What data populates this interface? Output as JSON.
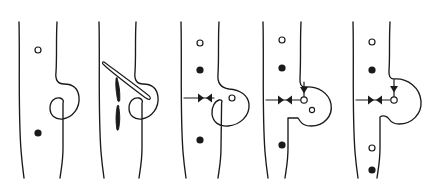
{
  "figure": {
    "type": "scientific-line-diagram",
    "background_color": "#ffffff",
    "stroke_color": "#1a1a1a",
    "width": 436,
    "height": 193,
    "panel_count": 5
  },
  "panels": [
    {
      "id": "panel-1",
      "index": 1,
      "stage_label": "1",
      "left_boundary": {
        "x_top": 18,
        "x_bottom": 24
      },
      "right_boundary": {
        "x_top": 56,
        "x_bottom": 60
      },
      "markers": [
        {
          "name": "open-dot",
          "style": "open",
          "cx": 38,
          "cy": 50,
          "r": 3
        },
        {
          "name": "filled-dot",
          "style": "filled",
          "cx": 38,
          "cy": 133,
          "r": 3.6
        }
      ],
      "features": [
        "bud-outline"
      ]
    },
    {
      "id": "panel-2",
      "index": 2,
      "stage_label": "2",
      "left_boundary": {
        "x_top": 98,
        "x_bottom": 103
      },
      "right_boundary": {
        "x_top": 134,
        "x_bottom": 138
      },
      "markers": [
        {
          "name": "dark-spindle",
          "style": "filled-spindle",
          "cx": 117,
          "cy": 103
        },
        {
          "name": "open-needle",
          "style": "open-spindle",
          "angle_deg": 34
        }
      ],
      "features": [
        "bud-outline",
        "neck-constriction"
      ]
    },
    {
      "id": "panel-3",
      "index": 3,
      "stage_label": "3",
      "left_boundary": {
        "x_top": 180,
        "x_bottom": 186
      },
      "right_boundary": {
        "x_top": 218,
        "x_bottom": 222
      },
      "markers": [
        {
          "name": "open-dot",
          "style": "open",
          "cx": 200,
          "cy": 43,
          "r": 3
        },
        {
          "name": "filled-dot",
          "style": "filled",
          "cx": 200,
          "cy": 70,
          "r": 3.6
        },
        {
          "name": "filled-dot",
          "style": "filled",
          "cx": 200,
          "cy": 140,
          "r": 3.6
        },
        {
          "name": "open-dot-inner",
          "style": "open",
          "cx": 232,
          "cy": 98,
          "r": 3
        },
        {
          "name": "arrowhead-pair-horizontal",
          "style": "opposed-triangles",
          "cy": 98
        }
      ],
      "features": [
        "bud-outline",
        "neck-constriction",
        "horizontal-tension-arrows"
      ]
    },
    {
      "id": "panel-4",
      "index": 4,
      "stage_label": "4",
      "left_boundary": {
        "x_top": 262,
        "x_bottom": 268
      },
      "right_boundary": {
        "x_top": 300,
        "x_bottom": 304
      },
      "markers": [
        {
          "name": "open-dot",
          "style": "open",
          "cx": 282,
          "cy": 40,
          "r": 3
        },
        {
          "name": "filled-dot",
          "style": "filled",
          "cx": 282,
          "cy": 68,
          "r": 3.6
        },
        {
          "name": "filled-dot",
          "style": "filled",
          "cx": 282,
          "cy": 145,
          "r": 3.6
        },
        {
          "name": "open-dot-junction",
          "style": "open",
          "cx": 304,
          "cy": 100,
          "r": 3.2
        },
        {
          "name": "open-dot-inner",
          "style": "open",
          "cx": 312,
          "cy": 110,
          "r": 2.6
        },
        {
          "name": "arrowhead-pair-horizontal",
          "style": "opposed-triangles",
          "cy": 100
        },
        {
          "name": "arrowhead-down-vertical",
          "style": "down-triangle",
          "cx": 304
        }
      ],
      "features": [
        "bud-outline",
        "neck-constriction",
        "horizontal-tension-arrows",
        "vertical-tension-arrow"
      ]
    },
    {
      "id": "panel-5",
      "index": 5,
      "stage_label": "5",
      "left_boundary": {
        "x_top": 352,
        "x_bottom": 358
      },
      "right_boundary": {
        "x_top": 388,
        "x_bottom": 392
      },
      "markers": [
        {
          "name": "open-dot",
          "style": "open",
          "cx": 372,
          "cy": 42,
          "r": 3
        },
        {
          "name": "filled-dot",
          "style": "filled",
          "cx": 372,
          "cy": 70,
          "r": 3.6
        },
        {
          "name": "open-dot",
          "style": "open",
          "cx": 372,
          "cy": 148,
          "r": 3
        },
        {
          "name": "filled-dot",
          "style": "filled",
          "cx": 372,
          "cy": 170,
          "r": 3.6
        },
        {
          "name": "open-dot-junction",
          "style": "open",
          "cx": 394,
          "cy": 100,
          "r": 3.2
        },
        {
          "name": "arrowhead-pair-horizontal",
          "style": "opposed-triangles",
          "cy": 100
        },
        {
          "name": "arrowhead-down-vertical",
          "style": "down-triangle",
          "cx": 394
        }
      ],
      "features": [
        "bud-outline",
        "broad-vesicle",
        "horizontal-tension-arrows",
        "vertical-tension-arrow"
      ]
    }
  ]
}
